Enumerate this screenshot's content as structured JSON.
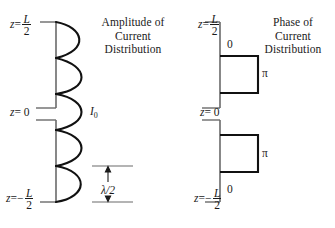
{
  "figure": {
    "type": "diagram"
  },
  "panels": [
    {
      "id": "amplitude",
      "title_lines": [
        "Amplitude of",
        "Current",
        "Distribution"
      ],
      "axis": {
        "top_label": {
          "var": "z",
          "eq": "=",
          "num": "L",
          "den": "2",
          "sign": ""
        },
        "zero_label": {
          "var": "z",
          "eq": "= 0"
        },
        "bottom_label": {
          "var": "z",
          "eq": "=",
          "num": "L",
          "den": "2",
          "sign": "−"
        }
      },
      "annotations": {
        "peak_current": "I",
        "peak_current_sub": "0",
        "half_wavelength": "λ/2"
      },
      "curve": {
        "kind": "rectified-sine",
        "lobes": 5,
        "side": "right",
        "peak_amplitude_px": 34
      }
    },
    {
      "id": "phase",
      "title_lines": [
        "Phase of",
        "Current",
        "Distribution"
      ],
      "axis": {
        "top_label": {
          "var": "z",
          "eq": "=",
          "num": "L",
          "den": "2",
          "sign": ""
        },
        "zero_label": {
          "var": "z",
          "eq": "= 0"
        },
        "bottom_label": {
          "var": "z",
          "eq": "=",
          "num": "L",
          "den": "2",
          "sign": "−"
        }
      },
      "steps": [
        {
          "value": "0",
          "position": "upper-top"
        },
        {
          "value": "π",
          "position": "upper-block"
        },
        {
          "value": "π",
          "position": "lower-block"
        },
        {
          "value": "0",
          "position": "lower-bottom"
        }
      ]
    }
  ],
  "colors": {
    "ink": "#1a1a1a",
    "axis": "#555555",
    "background": "#ffffff"
  }
}
